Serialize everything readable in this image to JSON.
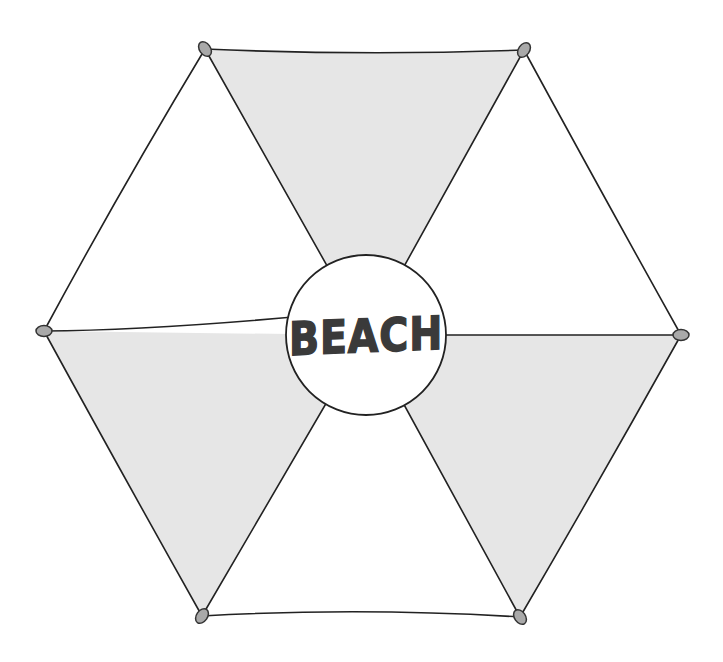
{
  "illustration": {
    "subject": "beach umbrella top view",
    "center_label": "BEACH",
    "colors": {
      "outline": "#222222",
      "shaded_panel": "#e6e6e6",
      "plain_panel": "#ffffff",
      "tip_cap": "#a9a9a9",
      "label_text": "#3a3a3a",
      "center_disc": "#ffffff"
    },
    "panels": [
      {
        "name": "top",
        "shaded": true
      },
      {
        "name": "upper-right",
        "shaded": false
      },
      {
        "name": "lower-right",
        "shaded": true
      },
      {
        "name": "bottom",
        "shaded": false
      },
      {
        "name": "lower-left",
        "shaded": true
      },
      {
        "name": "upper-left",
        "shaded": false
      }
    ],
    "tips": [
      "top-left",
      "top-right",
      "right",
      "bottom-right",
      "bottom-left",
      "left"
    ]
  }
}
